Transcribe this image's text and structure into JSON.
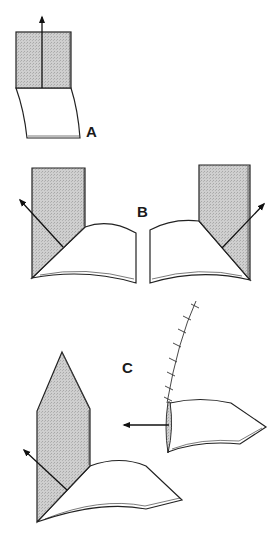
{
  "figure": {
    "panels": [
      {
        "id": "A",
        "label": "A",
        "description": "Rectangular shaded flap raised vertically with arrow pointing up"
      },
      {
        "id": "B",
        "label": "B",
        "description": "Left and right variants: shaded flap with diagonal fold and arrow pointing outward"
      },
      {
        "id": "C",
        "label": "C",
        "description": "Pointed shaded flap rotated; separate sutured flap with arrow pointing left"
      }
    ],
    "colors": {
      "stroke": "#222222",
      "shade": "#c8c8c8",
      "background": "#ffffff"
    }
  }
}
